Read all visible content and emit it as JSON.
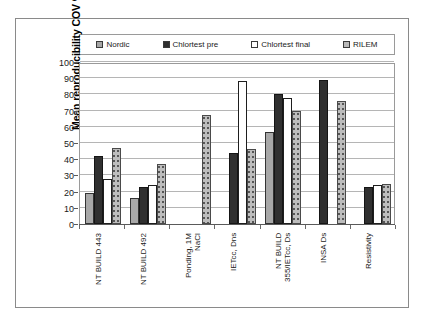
{
  "chart_data": {
    "type": "bar",
    "title": "",
    "xlabel": "",
    "ylabel": "Mean reproducibility COV %",
    "ylim": [
      0,
      100
    ],
    "ytick_step": 10,
    "yticks": [
      0,
      10,
      20,
      30,
      40,
      50,
      60,
      70,
      80,
      90,
      100
    ],
    "grid": true,
    "legend_position": "top",
    "categories": [
      "NT BUILD 443",
      "NT BUILD 492",
      "Ponding, 1M\nNaCl",
      "IETcc, Dns",
      "NT BUILD\n355/IETcc, Ds",
      "INSA Ds",
      "Resistivity"
    ],
    "series": [
      {
        "name": "Nordic",
        "color": "#a8a8a8",
        "values": [
          19,
          16,
          null,
          null,
          57,
          null,
          null
        ]
      },
      {
        "name": "Chlortest pre",
        "color": "#303030",
        "values": [
          42,
          23,
          null,
          44,
          80,
          89,
          23
        ]
      },
      {
        "name": "Chlortest final",
        "color": "#ffffff",
        "values": [
          28,
          24,
          null,
          88,
          78,
          null,
          24
        ]
      },
      {
        "name": "RILEM",
        "color": "#bdbdbd",
        "values": [
          47,
          37,
          67,
          46,
          70,
          76,
          25
        ]
      }
    ]
  },
  "legend": {
    "items": [
      {
        "label": "Nordic",
        "swatch": "sw-nordic"
      },
      {
        "label": "Chlortest pre",
        "swatch": "sw-pre"
      },
      {
        "label": "Chlortest final",
        "swatch": "sw-final"
      },
      {
        "label": "RILEM",
        "swatch": "sw-rilem"
      }
    ]
  },
  "axis": {
    "y_title": "Mean reproducibility COV %"
  }
}
